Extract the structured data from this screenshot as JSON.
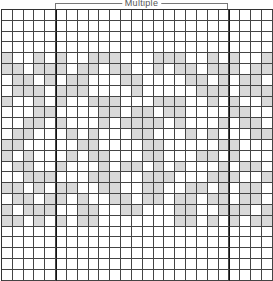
{
  "chart": {
    "title": "Multiple",
    "columns": 25,
    "rows": 25,
    "repeat_start_col": 5,
    "repeat_end_col": 21,
    "colors": {
      "shaded": "#d9d9d9",
      "empty": "#ffffff",
      "grid": "#444444"
    },
    "grid": [
      "0000000000000000000000000",
      "0000000000000000000000000",
      "0000000000000000000000000",
      "0000000000000000000000000",
      "1001010011100011100101001",
      "1101110110110010110111011",
      "0110101100011000011010110",
      "0111011100001000001110111",
      "1001010011100011100101001",
      "0001100001101101100001100",
      "0011010001011110100010110",
      "0110001010001100010100011",
      "1100000110000110000011000",
      "1010001011000110001101000",
      "0110010001011010100010110",
      "0011100011100111000111001",
      "1101011001100110011010110",
      "0110110100110110110110110",
      "1011100110011000110011101",
      "1101010110000000110101011",
      "0000000000000000000000000",
      "0000000000000000000000000",
      "0000000000000000000000000",
      "0000000000000000000000000",
      "0000000000000000000000000"
    ]
  }
}
